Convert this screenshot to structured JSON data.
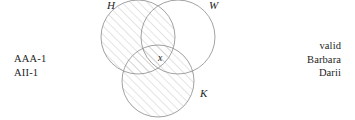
{
  "diagram": {
    "circles": [
      {
        "id": "H",
        "label": "H",
        "cx": 138,
        "cy": 37,
        "r": 37,
        "shaded": true,
        "label_x": 107,
        "label_y": 9
      },
      {
        "id": "W",
        "label": "W",
        "cx": 178,
        "cy": 37,
        "r": 37,
        "shaded": false,
        "label_x": 209,
        "label_y": 9
      },
      {
        "id": "K",
        "label": "K",
        "cx": 158,
        "cy": 81,
        "r": 36,
        "shaded": true,
        "label_x": 200,
        "label_y": 97
      }
    ],
    "markers": [
      {
        "id": "x",
        "label": "x",
        "x": 160,
        "y": 61
      }
    ],
    "stroke_color": "#8a8a8a",
    "hatch_color": "#c9c9c9",
    "text_color": "#1d1d1d",
    "background": "#ffffff"
  },
  "premises": {
    "lines": [
      "AAA-1",
      "AII-1"
    ]
  },
  "verdict": {
    "lines": [
      "valid",
      "Barbara",
      "Darii"
    ]
  }
}
